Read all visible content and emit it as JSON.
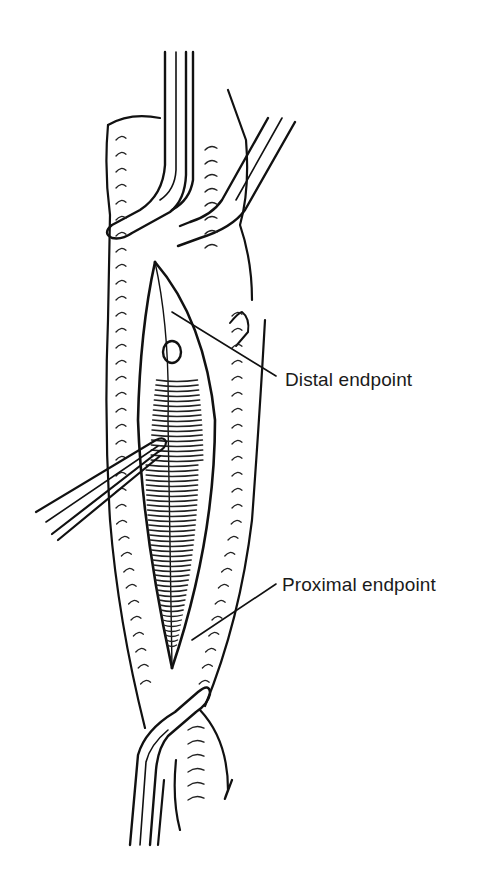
{
  "figure": {
    "colors": {
      "ink": "#111111",
      "background": "#ffffff"
    },
    "labels": [
      {
        "id": "distal",
        "text": "Distal endpoint"
      },
      {
        "id": "proximal",
        "text": "Proximal endpoint"
      }
    ]
  }
}
